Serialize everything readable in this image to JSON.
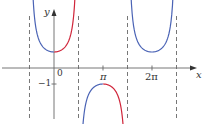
{
  "chart_data": {
    "type": "line",
    "title": "",
    "function": "y = sec x",
    "xlabel": "x",
    "ylabel": "y",
    "x_ticks": [
      {
        "value": 0,
        "label": "0"
      },
      {
        "value": 3.14159,
        "label": "π"
      },
      {
        "value": 6.28318,
        "label": "2π"
      }
    ],
    "y_ticks": [
      {
        "value": -1,
        "label": "−1"
      }
    ],
    "asymptotes": [
      -1.5708,
      1.5708,
      4.7124,
      7.854
    ],
    "xlim": [
      -2.2,
      8.8
    ],
    "ylim": [
      -3.1,
      3.6
    ],
    "grid": false,
    "legend": null,
    "series": [
      {
        "name": "branch-1-left",
        "color": "#4a63b5",
        "x_range": [
          -1.36,
          0
        ],
        "note": "sec x, decreasing to 1 at x=0"
      },
      {
        "name": "branch-1-right",
        "color": "#d0253a",
        "x_range": [
          0,
          1.36
        ],
        "note": "sec x, increasing from 1"
      },
      {
        "name": "branch-2-left",
        "color": "#4a63b5",
        "x_range": [
          1.78,
          3.14159
        ],
        "note": "sec x, rising to -1 at x=π"
      },
      {
        "name": "branch-2-right",
        "color": "#d0253a",
        "x_range": [
          3.14159,
          4.5
        ],
        "note": "sec x, falling from -1"
      },
      {
        "name": "branch-3",
        "color": "#4a63b5",
        "x_range": [
          4.92,
          7.64
        ],
        "note": "sec x, minimum 1 at x=2π"
      }
    ]
  },
  "labels": {
    "y_axis": "y",
    "x_axis": "x",
    "origin": "0",
    "neg_one": "−1",
    "pi": "π",
    "two_pi": "2π"
  },
  "colors": {
    "blue": "#4a63b5",
    "red": "#d0253a",
    "axis": "#666666",
    "dash": "#777777"
  }
}
